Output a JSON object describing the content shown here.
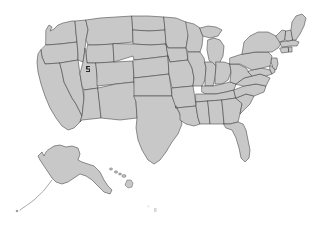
{
  "map": {
    "title": "United States map",
    "projection": "albers-usa",
    "background_color": "#ffffff",
    "state_fill_color": "#c8c8c8",
    "state_border_color": "#3c3c3c",
    "island_fill_color": "#c8c8c8",
    "aleutian_line_color": "#8a8a8a",
    "marker_color": "#2a2a2a",
    "artifact_color": "#b4b4b4",
    "state_count": 49,
    "includes_alaska_inset": "true",
    "includes_hawaii_inset": "true",
    "regions": {
      "contiguous_label": "Contiguous United States",
      "alaska_label": "Alaska",
      "hawaii_label": "Hawaii"
    },
    "states": [
      {
        "code": "WA",
        "name": "Washington"
      },
      {
        "code": "OR",
        "name": "Oregon"
      },
      {
        "code": "CA",
        "name": "California"
      },
      {
        "code": "NV",
        "name": "Nevada"
      },
      {
        "code": "ID",
        "name": "Idaho"
      },
      {
        "code": "MT",
        "name": "Montana"
      },
      {
        "code": "WY",
        "name": "Wyoming"
      },
      {
        "code": "UT",
        "name": "Utah"
      },
      {
        "code": "AZ",
        "name": "Arizona"
      },
      {
        "code": "CO",
        "name": "Colorado"
      },
      {
        "code": "NM",
        "name": "New Mexico"
      },
      {
        "code": "ND",
        "name": "North Dakota"
      },
      {
        "code": "SD",
        "name": "South Dakota"
      },
      {
        "code": "NE",
        "name": "Nebraska"
      },
      {
        "code": "KS",
        "name": "Kansas"
      },
      {
        "code": "OK",
        "name": "Oklahoma"
      },
      {
        "code": "TX",
        "name": "Texas"
      },
      {
        "code": "MN",
        "name": "Minnesota"
      },
      {
        "code": "IA",
        "name": "Iowa"
      },
      {
        "code": "MO",
        "name": "Missouri"
      },
      {
        "code": "AR",
        "name": "Arkansas"
      },
      {
        "code": "LA",
        "name": "Louisiana"
      },
      {
        "code": "WI",
        "name": "Wisconsin"
      },
      {
        "code": "IL",
        "name": "Illinois"
      },
      {
        "code": "MI",
        "name": "Michigan"
      },
      {
        "code": "IN",
        "name": "Indiana"
      },
      {
        "code": "OH",
        "name": "Ohio"
      },
      {
        "code": "KY",
        "name": "Kentucky"
      },
      {
        "code": "TN",
        "name": "Tennessee"
      },
      {
        "code": "MS",
        "name": "Mississippi"
      },
      {
        "code": "AL",
        "name": "Alabama"
      },
      {
        "code": "GA",
        "name": "Georgia"
      },
      {
        "code": "FL",
        "name": "Florida"
      },
      {
        "code": "SC",
        "name": "South Carolina"
      },
      {
        "code": "NC",
        "name": "North Carolina"
      },
      {
        "code": "VA",
        "name": "Virginia"
      },
      {
        "code": "WV",
        "name": "West Virginia"
      },
      {
        "code": "MD",
        "name": "Maryland"
      },
      {
        "code": "DE",
        "name": "Delaware"
      },
      {
        "code": "NJ",
        "name": "New Jersey"
      },
      {
        "code": "PA",
        "name": "Pennsylvania"
      },
      {
        "code": "NY",
        "name": "New York"
      },
      {
        "code": "CT",
        "name": "Connecticut"
      },
      {
        "code": "RI",
        "name": "Rhode Island"
      },
      {
        "code": "MA",
        "name": "Massachusetts"
      },
      {
        "code": "VT",
        "name": "Vermont"
      },
      {
        "code": "NH",
        "name": "New Hampshire"
      },
      {
        "code": "ME",
        "name": "Maine"
      },
      {
        "code": "AK",
        "name": "Alaska"
      },
      {
        "code": "HI",
        "name": "Hawaii"
      }
    ]
  }
}
